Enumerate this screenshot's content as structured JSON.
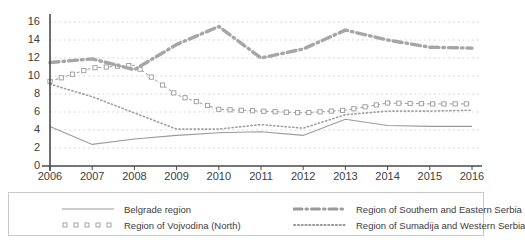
{
  "chart_data": {
    "type": "line",
    "title": "",
    "subtitle": "",
    "xlabel": "",
    "ylabel": "",
    "categories": [
      "2006",
      "2007",
      "2008",
      "2009",
      "2010",
      "2011",
      "2012",
      "2013",
      "2014",
      "2015",
      "2016"
    ],
    "xlim": [
      2006,
      2016
    ],
    "ylim": [
      0,
      16
    ],
    "ytick_values": [
      0,
      2,
      4,
      6,
      8,
      10,
      12,
      14,
      16
    ],
    "grid": "horizontal-dotted",
    "legend_position": "bottom",
    "series": [
      {
        "name": "Belgrade region",
        "style": "solid-thin",
        "color": "#9a9a9a",
        "marker": "none",
        "values": [
          4.4,
          2.4,
          3.0,
          3.4,
          3.7,
          3.8,
          3.4,
          5.2,
          4.5,
          4.4,
          4.4
        ]
      },
      {
        "name": "Region of Vojvodina (North)",
        "style": "dashed-square-markers",
        "color": "#9a9a9a",
        "marker": "open-square",
        "values": [
          9.4,
          10.9,
          11.2,
          7.9,
          6.3,
          6.1,
          5.9,
          6.2,
          7.0,
          6.9,
          6.9
        ]
      },
      {
        "name": "Region of Southern and Eastern Serbia",
        "style": "thick-dash-dot",
        "color": "#a6a6a6",
        "marker": "none",
        "values": [
          11.5,
          11.9,
          10.7,
          13.5,
          15.5,
          12.0,
          13.0,
          15.1,
          14.0,
          13.2,
          13.1
        ]
      },
      {
        "name": "Region of Sumadija and Western Serbia",
        "style": "fine-dotted",
        "color": "#9f9f9f",
        "marker": "none",
        "values": [
          9.1,
          7.7,
          5.9,
          4.1,
          4.1,
          4.6,
          4.2,
          5.7,
          6.1,
          6.1,
          6.2
        ]
      }
    ]
  },
  "axis": {
    "y_ticks": [
      "16",
      "14",
      "12",
      "10",
      "8",
      "6",
      "4",
      "2",
      "0"
    ],
    "x_ticks": [
      "2006",
      "2007",
      "2008",
      "2009",
      "2010",
      "2011",
      "2012",
      "2013",
      "2014",
      "2015",
      "2016"
    ]
  },
  "legend": {
    "items": [
      {
        "label": "Belgrade region",
        "style": "solid"
      },
      {
        "label": "Region of Vojvodina (North)",
        "style": "squares"
      },
      {
        "label": "Region of Southern and Eastern Serbia",
        "style": "dashdot"
      },
      {
        "label": "Region of Sumadija and Western Serbia",
        "style": "dotted"
      }
    ]
  },
  "colors": {
    "axis": "#4a4a4a",
    "grid": "#c4c4c4",
    "text": "#3d3d3d",
    "series_grey": "#9a9a9a"
  }
}
